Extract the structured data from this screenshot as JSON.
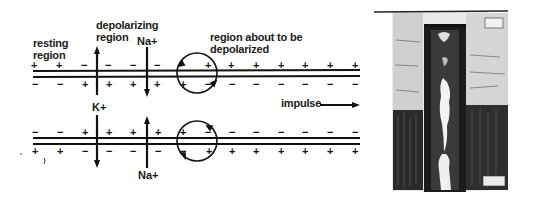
{
  "diagram": {
    "labels": {
      "resting_region": [
        "resting",
        "region"
      ],
      "depolarizing_region": [
        "depolarizing",
        "region"
      ],
      "region_about": [
        "region about to be",
        "depolarized"
      ],
      "impulse": "impulse",
      "na_top": "Na+",
      "k_ion": "K+",
      "na_bottom": "Na+"
    },
    "top_membrane": {
      "outer_signs": [
        "+",
        "+",
        "−",
        "−",
        "−",
        "−",
        "−",
        "+",
        "+",
        "+",
        "+",
        "+",
        "+",
        "+",
        "+"
      ],
      "inner_signs": [
        "−",
        "−",
        "+",
        "+",
        "+",
        "+",
        "+",
        "−",
        "−",
        "−",
        "−",
        "−",
        "−",
        "−",
        "−"
      ]
    },
    "bottom_membrane": {
      "inner_signs": [
        "−",
        "−",
        "+",
        "+",
        "+",
        "+",
        "+",
        "−",
        "−",
        "−",
        "−",
        "−",
        "−",
        "−",
        "−"
      ],
      "outer_signs": [
        "+",
        "+",
        "−",
        "−",
        "−",
        "−",
        "−",
        "+",
        "+",
        "+",
        "+",
        "+",
        "+",
        "+",
        "+"
      ]
    },
    "impulse_direction": "right"
  },
  "illustration": {
    "description": "pen-and-ink sketch of vertical shaft with figures"
  }
}
